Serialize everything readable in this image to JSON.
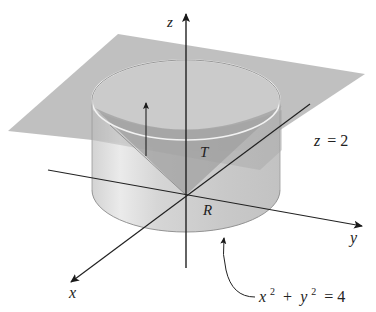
{
  "diagram": {
    "axes": {
      "z_label": "z",
      "y_label": "y",
      "x_label": "x"
    },
    "labels": {
      "surface": "T",
      "region": "R",
      "plane_eq_var": "z",
      "plane_eq_rest": "= 2",
      "circle_x": "x",
      "circle_exp1": "2",
      "circle_plus": "+",
      "circle_y": "y",
      "circle_exp2": "2",
      "circle_rest": "= 4"
    },
    "colors": {
      "plane": "#b4b4b4",
      "cylinder": "#d6d6d6",
      "cone": "#a9a9a9",
      "axis": "#222222",
      "rim": "#f4f4f4"
    }
  }
}
